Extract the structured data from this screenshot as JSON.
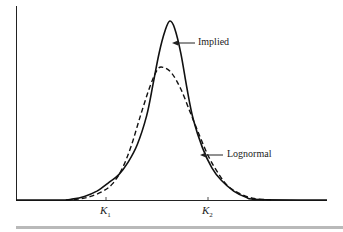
{
  "chart_data": {
    "type": "line",
    "title": "",
    "xlabel": "",
    "ylabel": "",
    "grid": false,
    "legend": "inline annotations with arrows",
    "x_ticks": [
      {
        "label": "K",
        "sub": "1",
        "x": 0.33
      },
      {
        "label": "K",
        "sub": "2",
        "x": 0.66
      }
    ],
    "series": [
      {
        "name": "Implied",
        "style": "solid",
        "points": [
          [
            0,
            0
          ],
          [
            0.14,
            0
          ],
          [
            0.18,
            0.005
          ],
          [
            0.22,
            0.02
          ],
          [
            0.26,
            0.05
          ],
          [
            0.3,
            0.1
          ],
          [
            0.33,
            0.14
          ],
          [
            0.36,
            0.21
          ],
          [
            0.39,
            0.31
          ],
          [
            0.42,
            0.47
          ],
          [
            0.44,
            0.64
          ],
          [
            0.46,
            0.82
          ],
          [
            0.48,
            0.95
          ],
          [
            0.495,
            1.0
          ],
          [
            0.51,
            0.96
          ],
          [
            0.53,
            0.82
          ],
          [
            0.55,
            0.62
          ],
          [
            0.57,
            0.45
          ],
          [
            0.6,
            0.29
          ],
          [
            0.63,
            0.18
          ],
          [
            0.66,
            0.11
          ],
          [
            0.7,
            0.05
          ],
          [
            0.74,
            0.015
          ],
          [
            0.78,
            0.003
          ],
          [
            1.0,
            0
          ]
        ]
      },
      {
        "name": "Lognormal",
        "style": "dashed",
        "points": [
          [
            0.16,
            0
          ],
          [
            0.2,
            0.005
          ],
          [
            0.24,
            0.02
          ],
          [
            0.28,
            0.05
          ],
          [
            0.31,
            0.09
          ],
          [
            0.34,
            0.17
          ],
          [
            0.37,
            0.3
          ],
          [
            0.4,
            0.47
          ],
          [
            0.43,
            0.63
          ],
          [
            0.455,
            0.73
          ],
          [
            0.475,
            0.74
          ],
          [
            0.5,
            0.71
          ],
          [
            0.53,
            0.62
          ],
          [
            0.56,
            0.49
          ],
          [
            0.59,
            0.36
          ],
          [
            0.62,
            0.24
          ],
          [
            0.65,
            0.15
          ],
          [
            0.68,
            0.08
          ],
          [
            0.72,
            0.035
          ],
          [
            0.76,
            0.01
          ],
          [
            0.8,
            0.002
          ],
          [
            0.82,
            0
          ]
        ]
      }
    ],
    "annotations": [
      {
        "text": "Implied",
        "target_series": "Implied"
      },
      {
        "text": "Lognormal",
        "target_series": "Lognormal"
      }
    ]
  },
  "labels": {
    "implied": "Implied",
    "lognormal": "Lognormal",
    "k1_main": "K",
    "k1_sub": "1",
    "k2_main": "K",
    "k2_sub": "2"
  }
}
